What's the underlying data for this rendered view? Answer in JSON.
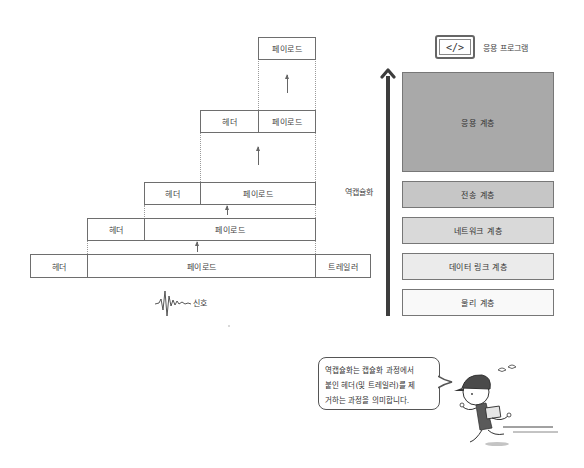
{
  "encapsulation_stack": {
    "rows": [
      {
        "cells": [
          {
            "text": "페이로드"
          }
        ]
      },
      {
        "cells": [
          {
            "text": "헤더"
          },
          {
            "text": "페이로드"
          }
        ]
      },
      {
        "cells": [
          {
            "text": "헤더"
          },
          {
            "text": "페이로드"
          }
        ]
      },
      {
        "cells": [
          {
            "text": "헤더"
          },
          {
            "text": "페이로드"
          }
        ]
      },
      {
        "cells": [
          {
            "text": "헤더"
          },
          {
            "text": "페이로드"
          },
          {
            "text": "트레일러"
          }
        ]
      }
    ],
    "signal_label": "신호"
  },
  "layers": {
    "app_program_icon": "</>",
    "app_program_label": "응용 프로그램",
    "direction_label": "역캡슐화",
    "items": [
      {
        "label": "응용 계층",
        "color": "#a9a9a9"
      },
      {
        "label": "전송 계층",
        "color": "#c6c6c6"
      },
      {
        "label": "네트워크 계층",
        "color": "#d9d9d9"
      },
      {
        "label": "데이터 링크 계층",
        "color": "#ebebeb"
      },
      {
        "label": "물리 계층",
        "color": "#f9f9f9"
      }
    ]
  },
  "callout": {
    "lines": [
      "역캡슐화는 캡슐화 과정에서",
      "붙인 헤더(및 트레일러)를 제",
      "거하는 과정을 의미합니다."
    ]
  }
}
